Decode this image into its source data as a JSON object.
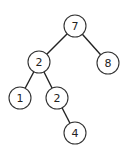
{
  "diagram": {
    "type": "binary-tree",
    "nodes": [
      {
        "id": "n7",
        "label": "7",
        "x": 75,
        "y": 26
      },
      {
        "id": "n2a",
        "label": "2",
        "x": 39,
        "y": 62
      },
      {
        "id": "n8",
        "label": "8",
        "x": 108,
        "y": 63
      },
      {
        "id": "n1",
        "label": "1",
        "x": 20,
        "y": 98
      },
      {
        "id": "n2b",
        "label": "2",
        "x": 57,
        "y": 98
      },
      {
        "id": "n4",
        "label": "4",
        "x": 75,
        "y": 133
      }
    ],
    "edges": [
      {
        "from": "n7",
        "to": "n2a"
      },
      {
        "from": "n7",
        "to": "n8"
      },
      {
        "from": "n2a",
        "to": "n1"
      },
      {
        "from": "n2a",
        "to": "n2b"
      },
      {
        "from": "n2b",
        "to": "n4"
      }
    ],
    "node_radius": 11
  }
}
